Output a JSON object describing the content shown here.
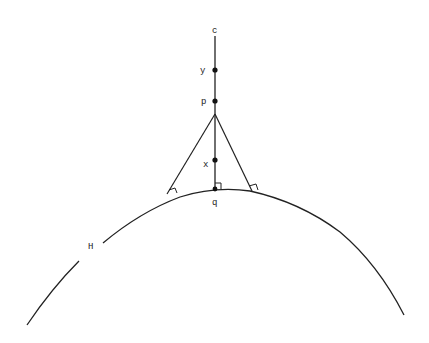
{
  "diagram": {
    "stroke_color": "#222222",
    "background": "#ffffff",
    "labels": {
      "c": "c",
      "y": "y",
      "p": "p",
      "x": "x",
      "q": "q",
      "H": "H"
    },
    "points": [
      {
        "name": "c",
        "role": "top endpoint of vertical line"
      },
      {
        "name": "y",
        "role": "point on vertical line (dot)"
      },
      {
        "name": "p",
        "role": "point on vertical line (dot)"
      },
      {
        "name": "x",
        "role": "point on vertical line (dot)"
      },
      {
        "name": "q",
        "role": "foot of perpendicular on curve H (dot)"
      }
    ],
    "curve": {
      "name": "H",
      "shape": "downward-opening arc"
    },
    "right_angle_markers": 3
  }
}
